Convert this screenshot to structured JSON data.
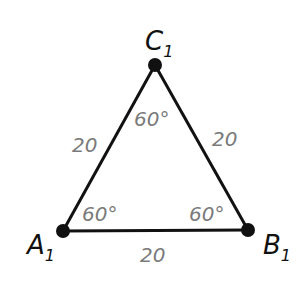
{
  "diagram": {
    "type": "equilateral-triangle",
    "colors": {
      "edge": "#111111",
      "vertex": "#111111",
      "measure_text": "#7a7a7a",
      "label_text": "#111111"
    },
    "vertices": [
      {
        "id": "A1",
        "letter": "A",
        "subscript": "1",
        "x": 63,
        "y": 231
      },
      {
        "id": "B1",
        "letter": "B",
        "subscript": "1",
        "x": 248,
        "y": 230
      },
      {
        "id": "C1",
        "letter": "C",
        "subscript": "1",
        "x": 155,
        "y": 65
      }
    ],
    "sides": [
      {
        "from": "A1",
        "to": "C1",
        "length_label": "20"
      },
      {
        "from": "C1",
        "to": "B1",
        "length_label": "20"
      },
      {
        "from": "A1",
        "to": "B1",
        "length_label": "20"
      }
    ],
    "angles": [
      {
        "vertex": "A1",
        "label": "60°"
      },
      {
        "vertex": "B1",
        "label": "60°"
      },
      {
        "vertex": "C1",
        "label": "60°"
      }
    ]
  }
}
